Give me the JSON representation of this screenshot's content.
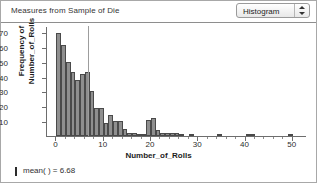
{
  "window": {
    "title": "Measures from Sample of Die"
  },
  "toolbar": {
    "plot_type": "Histogram",
    "stepper_icon": "up-down-stepper-icon"
  },
  "footer": {
    "marker_icon": "vertical-line-marker-icon",
    "mean_text": "mean( ) = 6.68"
  },
  "chart_data": {
    "type": "bar",
    "title": "Measures from Sample of Die",
    "xlabel": "Number_of_Rolls",
    "ylabel": "Frequency of Number_of_Rolls",
    "xlim": [
      -2,
      53
    ],
    "ylim": [
      0,
      74
    ],
    "grid": false,
    "legend": null,
    "xticks": [
      0,
      10,
      20,
      30,
      40,
      50
    ],
    "yticks": [
      10,
      20,
      30,
      40,
      50,
      60,
      70
    ],
    "bin_width": 1,
    "annotations": [
      {
        "name": "mean-reference-line",
        "x": 6.68,
        "label": "mean( ) = 6.68"
      }
    ],
    "categories": [
      1,
      2,
      3,
      4,
      5,
      6,
      7,
      8,
      9,
      10,
      11,
      12,
      13,
      14,
      15,
      16,
      17,
      18,
      19,
      20,
      21,
      22,
      23,
      24,
      25,
      26,
      27,
      28,
      29,
      30,
      31,
      32,
      33,
      34,
      35,
      36,
      37,
      38,
      39,
      40,
      41,
      42,
      43,
      44,
      45,
      46,
      47,
      48,
      49,
      50,
      51
    ],
    "values": [
      69,
      61,
      50,
      43,
      38,
      42,
      43,
      30,
      19,
      19,
      9,
      14,
      10,
      10,
      5,
      2,
      2,
      1,
      1,
      11,
      12,
      4,
      2,
      2,
      2,
      2,
      1,
      0,
      1,
      0,
      0,
      0,
      0,
      0,
      1,
      0,
      0,
      0,
      0,
      0,
      1,
      1,
      0,
      0,
      0,
      0,
      0,
      0,
      0,
      1,
      0
    ]
  }
}
